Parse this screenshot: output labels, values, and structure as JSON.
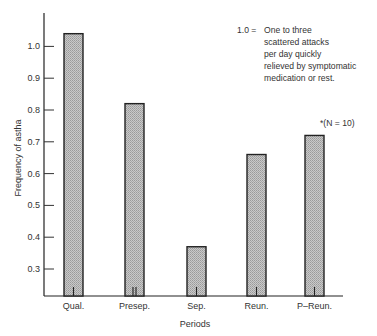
{
  "chart_data": {
    "type": "bar",
    "title": "",
    "xlabel": "Periods",
    "ylabel": "Frequency of astha",
    "categories": [
      "Qual.",
      "Presep.",
      "Sep.",
      "Reun.",
      "P–Reun."
    ],
    "values": [
      1.04,
      0.82,
      0.37,
      0.66,
      0.72
    ],
    "yticks": [
      "1.0",
      "0.9",
      "0.8",
      "0.7",
      "0.6",
      "0.5",
      "0.4",
      "0.3"
    ],
    "ytick_values": [
      1.0,
      0.9,
      0.8,
      0.7,
      0.6,
      0.5,
      0.4,
      0.3
    ],
    "ylim": [
      0.21,
      1.09
    ],
    "grid": false,
    "legend": null,
    "bar_fill": "hatched gray",
    "annotations": {
      "scale_key": "1.0 =",
      "scale_description": [
        "One to three",
        "scattered attacks",
        "per day quickly",
        "relieved by symptomatic",
        "medication or rest."
      ],
      "sample_note": "*(N = 10)"
    }
  }
}
